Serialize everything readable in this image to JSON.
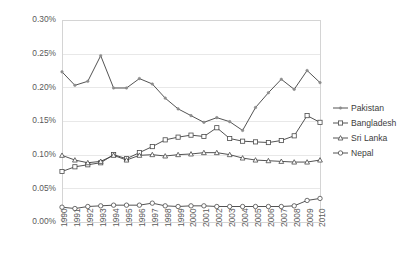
{
  "chart_data": {
    "type": "line",
    "title": "",
    "subtitle": "",
    "xlabel": "",
    "ylabel": "",
    "grid": true,
    "legend_position": "right",
    "ylim": [
      0.0,
      0.3
    ],
    "ytick_labels": [
      "0.00%",
      "0.05%",
      "0.10%",
      "0.15%",
      "0.20%",
      "0.25%",
      "0.30%"
    ],
    "ytick_values": [
      0.0,
      0.05,
      0.1,
      0.15,
      0.2,
      0.25,
      0.3
    ],
    "categories": [
      "1990",
      "1991",
      "1992",
      "1993",
      "1994",
      "1995",
      "1996",
      "1997",
      "1998",
      "1999",
      "2000",
      "2001",
      "2002",
      "2003",
      "2004",
      "2005",
      "2006",
      "2007",
      "2008",
      "2009",
      "2010"
    ],
    "series": [
      {
        "name": "Pakistan",
        "marker": "none",
        "values": [
          0.223,
          0.203,
          0.209,
          0.247,
          0.199,
          0.199,
          0.213,
          0.205,
          0.184,
          0.168,
          0.158,
          0.148,
          0.155,
          0.149,
          0.136,
          0.17,
          0.192,
          0.212,
          0.197,
          0.225,
          0.207
        ]
      },
      {
        "name": "Bangladesh",
        "marker": "square",
        "values": [
          0.075,
          0.082,
          0.085,
          0.088,
          0.1,
          0.094,
          0.103,
          0.112,
          0.122,
          0.126,
          0.129,
          0.127,
          0.14,
          0.124,
          0.12,
          0.119,
          0.118,
          0.121,
          0.128,
          0.158,
          0.148
        ]
      },
      {
        "name": "Sri Lanka",
        "marker": "triangle",
        "values": [
          0.099,
          0.092,
          0.088,
          0.09,
          0.099,
          0.092,
          0.099,
          0.1,
          0.098,
          0.1,
          0.101,
          0.103,
          0.103,
          0.1,
          0.095,
          0.092,
          0.091,
          0.09,
          0.089,
          0.089,
          0.092
        ]
      },
      {
        "name": "Nepal",
        "marker": "circle",
        "values": [
          0.022,
          0.02,
          0.023,
          0.024,
          0.025,
          0.025,
          0.025,
          0.028,
          0.024,
          0.023,
          0.024,
          0.024,
          0.023,
          0.023,
          0.023,
          0.023,
          0.023,
          0.023,
          0.024,
          0.032,
          0.035
        ]
      }
    ]
  },
  "legend": {
    "items": [
      {
        "label": "Pakistan",
        "marker": "none"
      },
      {
        "label": "Bangladesh",
        "marker": "square"
      },
      {
        "label": "Sri Lanka",
        "marker": "triangle"
      },
      {
        "label": "Nepal",
        "marker": "circle"
      }
    ]
  },
  "colors": {
    "line": "#3f3f3f",
    "grid": "#e8e8e8",
    "axis": "#d4d4d4",
    "text": "#5a5a5a",
    "background": "#ffffff"
  }
}
